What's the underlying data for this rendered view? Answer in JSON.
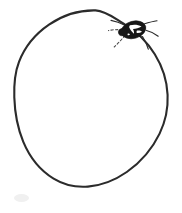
{
  "image": {
    "title": "Hand-drawn egg with insect",
    "width": 182,
    "height": 213,
    "background_color": "#ffffff",
    "ink_color": "#2b2b2b",
    "medium": "pen line drawing",
    "caption": ""
  },
  "scene": {
    "subjects": [
      {
        "name": "egg-outline",
        "description": "Large closed oval / egg shape drawn as a single freehand contour, tilted slightly, occupying most of the frame",
        "stroke_color": "#2b2b2b",
        "stroke_width": 2.1,
        "filled": false,
        "bounds": {
          "left": 14,
          "top": 10,
          "right": 168,
          "bottom": 187
        }
      },
      {
        "name": "insect",
        "description": "Small dark insect (tick or beetle) resting on the upper-right edge of the egg, solid black oval body with white highlight flecks and six thin radiating legs",
        "body_color": "#161616",
        "highlight_color": "#ffffff",
        "leg_color": "#2a2a2a",
        "leg_count": 6,
        "bounds": {
          "left": 108,
          "top": 17,
          "right": 160,
          "bottom": 50
        }
      },
      {
        "name": "paper-smudge",
        "description": "Very faint grey smudge on the blank paper below the egg",
        "color": "#f0f0f0",
        "bounds": {
          "left": 14,
          "top": 193,
          "right": 30,
          "bottom": 203
        }
      }
    ]
  }
}
